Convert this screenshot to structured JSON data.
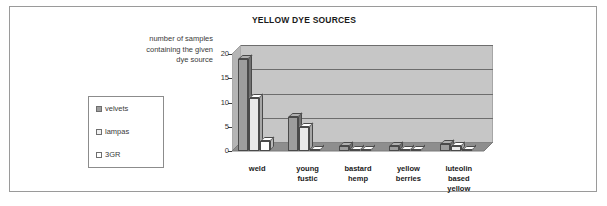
{
  "chart_data": {
    "type": "bar",
    "title": "YELLOW DYE SOURCES",
    "xlabel": "",
    "ylabel": "number of samples containing the given dye source",
    "ylabel_lines": [
      "number of samples",
      "containing the given",
      "dye source"
    ],
    "categories": [
      "weld",
      "young fustic",
      "bastard hemp",
      "yellow berries",
      "luteolin based yellow"
    ],
    "category_lines": [
      [
        "weld"
      ],
      [
        "young",
        "fustic"
      ],
      [
        "bastard",
        "hemp"
      ],
      [
        "yellow",
        "berries"
      ],
      [
        "luteolin",
        "based",
        "yellow"
      ]
    ],
    "series": [
      {
        "name": "velvets",
        "color": "#9d9d9d",
        "values": [
          19,
          7,
          1,
          1,
          1.5
        ]
      },
      {
        "name": "lampas",
        "color": "#e8e8e8",
        "values": [
          11,
          5,
          0,
          0,
          1
        ]
      },
      {
        "name": "3GR",
        "color": "#ffffff",
        "values": [
          2,
          0,
          0,
          0,
          0
        ]
      }
    ],
    "yticks": [
      0,
      5,
      10,
      15,
      20
    ],
    "ylim": [
      0,
      20
    ],
    "grid": true,
    "legend_position": "left",
    "style": "3d-column",
    "plot_background": "#c6c6c6",
    "gridline_color": "#6d6d6d",
    "floor_color": "#8e8e8e"
  },
  "legend": {
    "items": [
      {
        "label": "velvets",
        "color": "#9d9d9d"
      },
      {
        "label": "lampas",
        "color": "#e8e8e8"
      },
      {
        "label": "3GR",
        "color": "#ffffff"
      }
    ]
  }
}
